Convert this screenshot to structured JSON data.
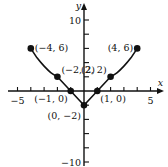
{
  "chart_data": {
    "type": "line",
    "title": "",
    "xlabel": "x",
    "ylabel": "y",
    "xlim": [
      -6,
      6
    ],
    "ylim": [
      -10.5,
      11
    ],
    "x_ticks": [
      -5,
      -4,
      -3,
      -2,
      -1,
      1,
      2,
      3,
      4,
      5
    ],
    "x_tick_labels": [
      {
        "value": -5,
        "label": "−5"
      },
      {
        "value": 5,
        "label": "5"
      }
    ],
    "y_ticks": [
      -10,
      -8,
      -6,
      -4,
      -2,
      2,
      4,
      6,
      8,
      10
    ],
    "y_tick_labels": [
      {
        "value": 10,
        "label": "10"
      },
      {
        "value": -10,
        "label": "−10"
      }
    ],
    "grid": false,
    "series": [
      {
        "name": "graph",
        "segments": [
          {
            "kind": "curve",
            "points": [
              [
                -4,
                6
              ],
              [
                -3.5,
                4.6
              ],
              [
                -3,
                3.5
              ],
              [
                -2.5,
                2.6
              ],
              [
                -2,
                2
              ]
            ]
          },
          {
            "kind": "line",
            "points": [
              [
                -2,
                2
              ],
              [
                -1,
                0
              ],
              [
                0,
                -2
              ]
            ]
          },
          {
            "kind": "line",
            "points": [
              [
                0,
                -2
              ],
              [
                1,
                0
              ],
              [
                2,
                2
              ]
            ]
          },
          {
            "kind": "curve",
            "points": [
              [
                2,
                2
              ],
              [
                2.5,
                2.6
              ],
              [
                3,
                3.5
              ],
              [
                3.5,
                4.6
              ],
              [
                4,
                6
              ]
            ]
          }
        ]
      }
    ],
    "annotations": [
      {
        "x": -4,
        "y": 6,
        "label": "(−4, 6)",
        "anchor": "right"
      },
      {
        "x": 4,
        "y": 6,
        "label": "(4, 6)",
        "anchor": "left"
      },
      {
        "x": -2,
        "y": 2,
        "label": "(−2, 2)",
        "anchor": "above-right"
      },
      {
        "x": 2,
        "y": 2,
        "label": "(2, 2)",
        "anchor": "above-left"
      },
      {
        "x": -1,
        "y": 0,
        "label": "(−1, 0)",
        "anchor": "below-left"
      },
      {
        "x": 1,
        "y": 0,
        "label": "(1, 0)",
        "anchor": "below-right"
      },
      {
        "x": 0,
        "y": -2,
        "label": "(0, −2)",
        "anchor": "below-left"
      }
    ]
  }
}
